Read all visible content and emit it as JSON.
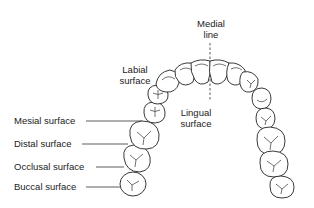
{
  "diagram": {
    "labels": {
      "medial": [
        "Medial",
        "line"
      ],
      "labial": [
        "Labial",
        "surface"
      ],
      "lingual": [
        "Lingual",
        "surface"
      ],
      "mesial": "Mesial surface",
      "distal": "Distal surface",
      "occlusal": "Occlusal surface",
      "buccal": "Buccal surface"
    },
    "colors": {
      "line": "#222222",
      "background": "#ffffff"
    }
  }
}
